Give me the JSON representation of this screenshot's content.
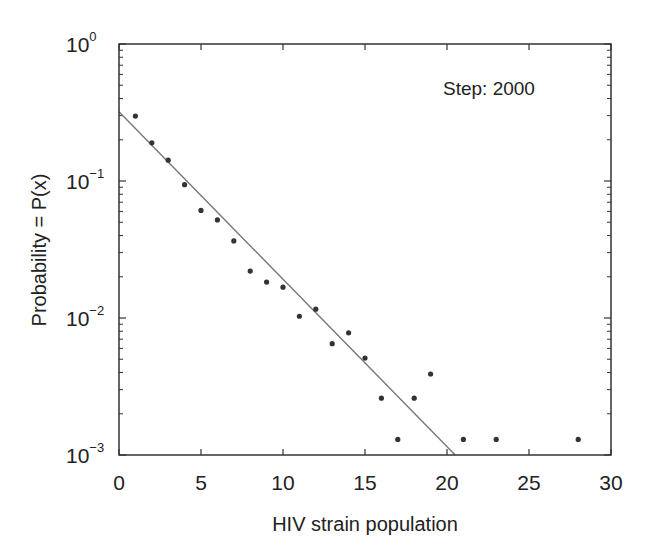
{
  "chart_data": {
    "type": "scatter",
    "title": "",
    "xlabel": "HIV strain population",
    "ylabel": "Probability = P(x)",
    "xscale": "linear",
    "yscale": "log",
    "xlim": [
      0,
      30
    ],
    "ylim": [
      0.001,
      1
    ],
    "x_ticks": [
      0,
      5,
      10,
      15,
      20,
      25,
      30
    ],
    "y_ticks": [
      {
        "value": 1,
        "base": "10",
        "exp": "0"
      },
      {
        "value": 0.1,
        "base": "10",
        "exp": "−1"
      },
      {
        "value": 0.01,
        "base": "10",
        "exp": "−2"
      },
      {
        "value": 0.001,
        "base": "10",
        "exp": "−3"
      }
    ],
    "grid": false,
    "annotations": [
      {
        "text": "Step: 2000",
        "x": 19.5,
        "y": 0.26
      }
    ],
    "series": [
      {
        "name": "data",
        "kind": "scatter",
        "color": "#333333",
        "x": [
          1,
          2,
          3,
          4,
          5,
          6,
          7,
          8,
          9,
          10,
          11,
          12,
          13,
          14,
          15,
          16,
          17,
          18,
          19,
          21,
          23,
          28
        ],
        "y": [
          0.298,
          0.19,
          0.142,
          0.094,
          0.061,
          0.052,
          0.0365,
          0.022,
          0.0183,
          0.0168,
          0.0103,
          0.0116,
          0.0065,
          0.0078,
          0.0051,
          0.0026,
          0.0013,
          0.0026,
          0.0039,
          0.0013,
          0.0013,
          0.0013
        ]
      },
      {
        "name": "fit",
        "kind": "line",
        "color": "#777777",
        "x": [
          0,
          20.5
        ],
        "y": [
          0.32,
          0.001
        ]
      }
    ]
  },
  "labels": {
    "xlabel": "HIV strain population",
    "ylabel": "Probability = P(x)",
    "annotation": "Step: 2000"
  }
}
